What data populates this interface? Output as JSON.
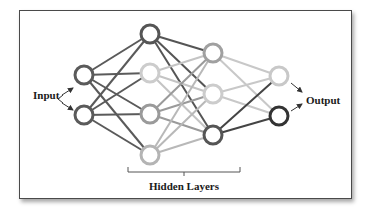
{
  "diagram": {
    "type": "neural-network",
    "labels": {
      "input": "Input",
      "output": "Output",
      "hidden": "Hidden Layers"
    },
    "layers": [
      {
        "name": "input",
        "nodes": [
          {
            "x": 84,
            "y": 75,
            "color": "#5a5a5a"
          },
          {
            "x": 84,
            "y": 115,
            "color": "#5a5a5a"
          }
        ]
      },
      {
        "name": "hidden-1",
        "nodes": [
          {
            "x": 150,
            "y": 34,
            "color": "#555555"
          },
          {
            "x": 150,
            "y": 73,
            "color": "#cccccc"
          },
          {
            "x": 150,
            "y": 114,
            "color": "#9a9a9a"
          },
          {
            "x": 150,
            "y": 155,
            "color": "#b4b4b4"
          }
        ]
      },
      {
        "name": "hidden-2",
        "nodes": [
          {
            "x": 213,
            "y": 53,
            "color": "#a0a0a0"
          },
          {
            "x": 213,
            "y": 94,
            "color": "#cccccc"
          },
          {
            "x": 213,
            "y": 135,
            "color": "#555555"
          }
        ]
      },
      {
        "name": "output",
        "nodes": [
          {
            "x": 279,
            "y": 76,
            "color": "#c8c8c8"
          },
          {
            "x": 279,
            "y": 116,
            "color": "#333333"
          }
        ]
      }
    ],
    "edge_colors": {
      "input": "#5a5a5a",
      "hidden1": [
        "#555555",
        "#c4c4c4",
        "#9a9a9a",
        "#b8b8b8"
      ],
      "hidden2": [
        "#c8c8c8",
        "#c8c8c8",
        "#444444"
      ]
    },
    "node_radius": 9,
    "colors": {
      "frame": "#4a4a4a",
      "text": "#1a1a1a",
      "arrow": "#333333",
      "bracket": "#555555"
    }
  }
}
